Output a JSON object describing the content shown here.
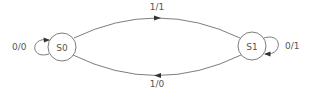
{
  "diagram": {
    "type": "finite-state-machine",
    "states": [
      {
        "id": "S0",
        "label": "S0"
      },
      {
        "id": "S1",
        "label": "S1"
      }
    ],
    "transitions": [
      {
        "from": "S0",
        "to": "S1",
        "label": "1/1"
      },
      {
        "from": "S1",
        "to": "S0",
        "label": "1/0"
      },
      {
        "from": "S0",
        "to": "S0",
        "label": "0/0"
      },
      {
        "from": "S1",
        "to": "S1",
        "label": "0/1"
      }
    ]
  },
  "colors": {
    "stroke": "#6e6e6e",
    "arrow": "#333333",
    "text": "#555555"
  }
}
